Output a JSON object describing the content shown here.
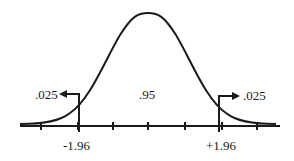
{
  "diagram": {
    "type": "normal-distribution",
    "curve_color": "#1a1a1a",
    "center_area_label": ".95",
    "left_tail": {
      "area_label": ".025",
      "critical_value": "-1.96"
    },
    "right_tail": {
      "area_label": ".025",
      "critical_value": "+1.96"
    },
    "tick_count": 7
  }
}
